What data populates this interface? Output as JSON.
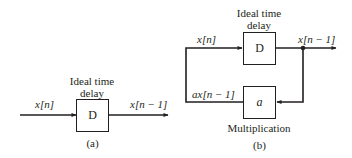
{
  "diagram_a": {
    "caption": "(a)",
    "delay_title_line1": "Ideal time",
    "delay_title_line2": "delay",
    "delay_block": "D",
    "input_label": "x[n]",
    "output_label": "x[n − 1]"
  },
  "diagram_b": {
    "caption": "(b)",
    "delay_title_line1": "Ideal time",
    "delay_title_line2": "delay",
    "delay_block": "D",
    "multiplier_block": "a",
    "multiplier_title": "Multiplication",
    "input_label": "x[n]",
    "output_label": "x[n − 1]",
    "feedback_label": "ax[n − 1]"
  },
  "colors": {
    "line": "#231f20",
    "background": "#ffffff"
  }
}
